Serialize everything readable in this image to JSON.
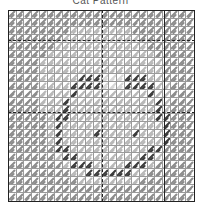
{
  "title": "Cat Pattern",
  "grid": {
    "cols": 24,
    "rows": 24,
    "legend_colors": {
      "0": "#ffffff",
      "1": "#b8b8b8",
      "2": "#8c8c8c",
      "3": "#3c3c3c",
      "4": "#d6d6d6"
    },
    "rows_data": [
      "222222222222222222222222",
      "222222222222222222222222",
      "222222221111111122222222",
      "222222211111111112222222",
      "222222111111111111222222",
      "222221111111111111122222",
      "222211111111111111112222",
      "222211111111111111112222",
      "222211111333444333112222",
      "222211113333444333311222",
      "222211113111111111311222",
      "222211131111111111131222",
      "222211131111111111131222",
      "222221331111111111133222",
      "222221311111111111113222",
      "222221311113111131113222",
      "222221311111111111113222",
      "222222331111111111332222",
      "222222133111111113312222",
      "222222213331111333122222",
      "222222221133333311222222",
      "222222222111111112222222",
      "222222222222222222222222",
      "222222222222222222222222"
    ]
  }
}
